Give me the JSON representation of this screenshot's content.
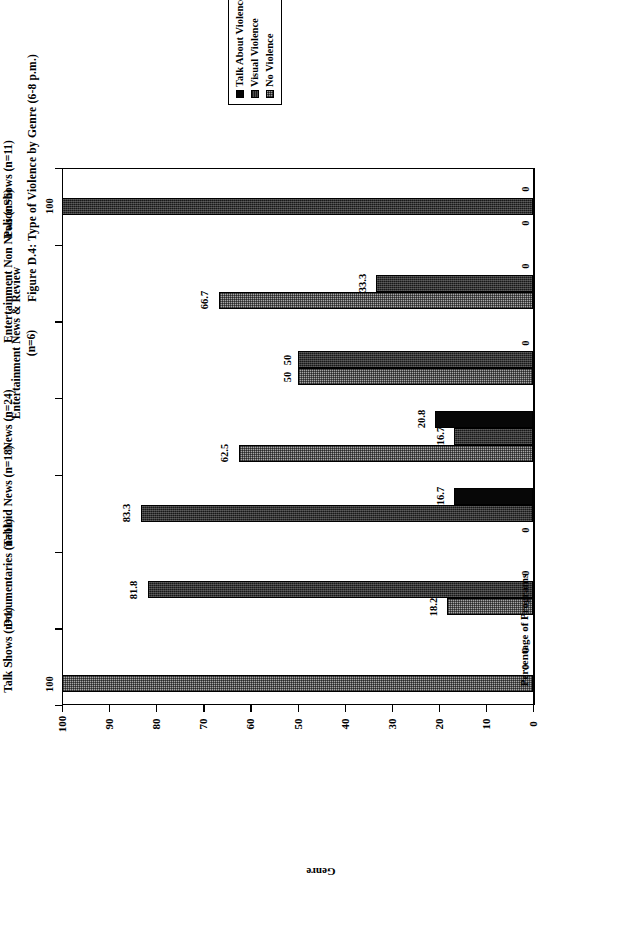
{
  "figure": {
    "title": "Figure D.4: Type of Violence by Genre (6-8 p.m.)"
  },
  "legend": {
    "position": "top-center",
    "items": [
      {
        "label": "Talk About Violence",
        "swatch": "solid-black-square-icon",
        "color": "#070707"
      },
      {
        "label": "Visual Violence",
        "swatch": "dark-hatch-square-icon",
        "color": "#181818"
      },
      {
        "label": "No Violence",
        "swatch": "gray-checker-square-icon",
        "color": "#a6a6a6"
      }
    ]
  },
  "axes": {
    "value_axis_title": "Percentage of Programs",
    "category_axis_title": "Genre",
    "value_ticks": [
      "0",
      "10",
      "20",
      "30",
      "40",
      "50",
      "60",
      "70",
      "80",
      "90",
      "100"
    ]
  },
  "chart_data": {
    "type": "bar",
    "orientation": "horizontal",
    "title": "Figure D.4: Type of Violence by Genre (6-8 p.m.)",
    "xlabel": "Percentage of Programs",
    "ylabel": "Genre",
    "xlim": [
      0,
      100
    ],
    "grid": false,
    "legend_position": "top-center",
    "categories": [
      "Police Shows (n=11)",
      "Entertainment Non News (n=6)",
      "Entertainment News & Review (n=6)",
      "News (n=24)",
      "Tabloid News (n=18)",
      "Documentaries (n=11)",
      "Talk Shows (n=1)"
    ],
    "series": [
      {
        "name": "Talk About Violence",
        "values": [
          0,
          0,
          0,
          20.8,
          16.7,
          0,
          0
        ]
      },
      {
        "name": "Visual Violence",
        "values": [
          100,
          33.3,
          50,
          16.7,
          83.3,
          81.8,
          0
        ]
      },
      {
        "name": "No Violence",
        "values": [
          0,
          66.7,
          50,
          62.5,
          0,
          18.2,
          100
        ]
      }
    ],
    "data_labels": [
      {
        "category": "Police Shows (n=11)",
        "talk": "0",
        "visual": "100",
        "none": "0"
      },
      {
        "category": "Entertainment Non News (n=6)",
        "talk": "0",
        "visual": "33.3",
        "none": "66.7"
      },
      {
        "category": "Entertainment News & Review (n=6)",
        "talk": "0",
        "visual": "50",
        "none": "50"
      },
      {
        "category": "News (n=24)",
        "talk": "20.8",
        "visual": "16.7",
        "none": "62.5"
      },
      {
        "category": "Tabloid News (n=18)",
        "talk": "16.7",
        "visual": "83.3",
        "none": "0"
      },
      {
        "category": "Documentaries (n=11)",
        "talk": "0",
        "visual": "81.8",
        "none": "18.2"
      },
      {
        "category": "Talk Shows (n=1)",
        "talk": "0",
        "visual": "0",
        "none": "100"
      }
    ]
  }
}
